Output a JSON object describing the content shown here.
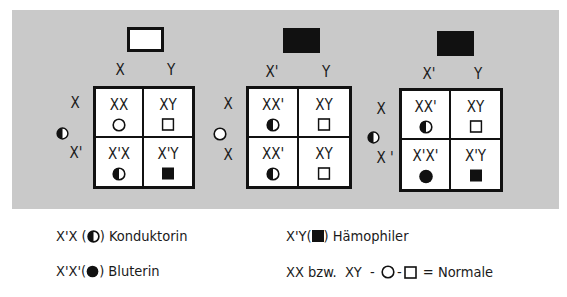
{
  "crosses": [
    {
      "father": {
        "type": "male-normal",
        "gametes": [
          "X",
          "Y"
        ]
      },
      "mother": {
        "symbol": "half-circle",
        "gametes": [
          "X",
          "X'"
        ]
      },
      "cells": [
        {
          "genotype": "XX",
          "symbol": "circle-open"
        },
        {
          "genotype": "XY",
          "symbol": "square-open"
        },
        {
          "genotype": "X'X",
          "symbol": "circle-half"
        },
        {
          "genotype": "X'Y",
          "symbol": "square-filled"
        }
      ]
    },
    {
      "father": {
        "type": "male-affected",
        "gametes": [
          "X'",
          "Y"
        ]
      },
      "mother": {
        "symbol": "circle-open",
        "gametes": [
          "X",
          "X"
        ]
      },
      "cells": [
        {
          "genotype": "XX'",
          "symbol": "circle-half"
        },
        {
          "genotype": "XY",
          "symbol": "square-open"
        },
        {
          "genotype": "XX'",
          "symbol": "circle-half"
        },
        {
          "genotype": "XY",
          "symbol": "square-open"
        }
      ]
    },
    {
      "father": {
        "type": "male-affected",
        "gametes": [
          "X'",
          "Y"
        ]
      },
      "mother": {
        "symbol": "half-circle",
        "gametes": [
          "X",
          "X '"
        ]
      },
      "cells": [
        {
          "genotype": "XX'",
          "symbol": "circle-half"
        },
        {
          "genotype": "XY",
          "symbol": "square-open"
        },
        {
          "genotype": "X'X'",
          "symbol": "circle-filled"
        },
        {
          "genotype": "X'Y",
          "symbol": "square-filled"
        }
      ]
    }
  ],
  "legend": {
    "conductor": {
      "prefix": "X'X (",
      "suffix": ") Konduktorin",
      "symbol": "circle-half"
    },
    "bleeder_female": {
      "prefix": "X'X'(",
      "suffix": ") Bluterin",
      "symbol": "circle-filled"
    },
    "hemophiliac": {
      "prefix": "X'Y(",
      "suffix": ") Hämophiler",
      "symbol": "square-filled"
    },
    "normal": {
      "prefix": "XX bzw.  XY  - ",
      "mid": "-",
      "suffix": " = Normale",
      "symbols": [
        "circle-open",
        "square-open"
      ]
    }
  },
  "colors": {
    "panel": "#c9c9c9",
    "ink": "#111111",
    "cell_bg": "#ffffff"
  }
}
